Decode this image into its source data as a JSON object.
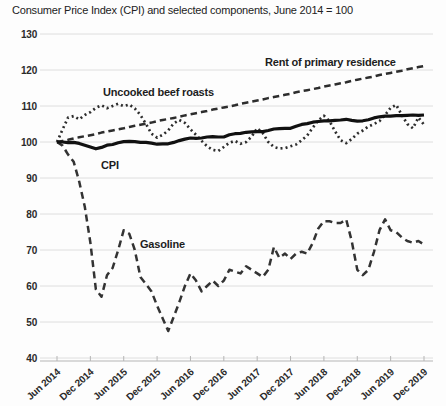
{
  "header": {
    "title": "Consumer Price Index (CPI) and selected components, June 2014 = 100"
  },
  "chart_data": {
    "type": "line",
    "title": "Consumer Price Index (CPI) and selected components, June 2014 = 100",
    "x_unit": "month",
    "x_range": [
      "Jun 2014",
      "Dec 2019"
    ],
    "x_tick_labels": [
      "Jun 2014",
      "Dec 2014",
      "Jun 2015",
      "Dec 2015",
      "Jun 2016",
      "Dec 2016",
      "Jun 2017",
      "Dec 2017",
      "Jun 2018",
      "Dec 2018",
      "Jun 2019",
      "Dec 2019"
    ],
    "y_ticks": [
      40,
      50,
      60,
      70,
      80,
      90,
      100,
      110,
      120,
      130
    ],
    "ylim": [
      40,
      130
    ],
    "grid": "horizontal",
    "legend": "inline-labels",
    "line_color": "#2d2d2d",
    "series": [
      {
        "id": "beef",
        "name": "Uncooked beef roasts",
        "style": "dotted",
        "color": "#2d2d2d",
        "label_pos": {
          "x": 103,
          "y": 96
        },
        "values": [
          100,
          103.5,
          106.8,
          107.2,
          106.3,
          107.5,
          108.3,
          109.5,
          110.2,
          109.4,
          110.0,
          110.6,
          110.0,
          110.4,
          109.3,
          107.5,
          105.0,
          102.3,
          101.2,
          102.0,
          103.2,
          105.2,
          106.1,
          105.3,
          103.5,
          102.0,
          100.3,
          98.8,
          97.8,
          97.5,
          98.6,
          99.8,
          100.3,
          99.5,
          100.0,
          101.5,
          103.8,
          102.5,
          100.0,
          98.6,
          98.2,
          98.3,
          98.8,
          99.3,
          100.5,
          101.8,
          104.0,
          106.0,
          107.3,
          105.8,
          103.0,
          100.5,
          99.7,
          100.8,
          102.3,
          103.2,
          104.3,
          105.0,
          105.8,
          107.5,
          109.5,
          110.3,
          107.5,
          105.0,
          103.8,
          106.8,
          104.8
        ]
      },
      {
        "id": "rent",
        "name": "Rent of primary residence",
        "style": "dashed",
        "color": "#2d2d2d",
        "label_pos": {
          "x": 265,
          "y": 66
        },
        "values": [
          100,
          100.3,
          100.6,
          101.0,
          101.3,
          101.6,
          101.9,
          102.2,
          102.6,
          102.9,
          103.2,
          103.5,
          103.8,
          104.2,
          104.5,
          104.8,
          105.1,
          105.4,
          105.8,
          106.1,
          106.4,
          106.7,
          107.0,
          107.4,
          107.7,
          108.0,
          108.3,
          108.6,
          109.0,
          109.3,
          109.6,
          109.9,
          110.2,
          110.6,
          110.9,
          111.2,
          111.5,
          111.8,
          112.2,
          112.5,
          112.8,
          113.1,
          113.4,
          113.8,
          114.1,
          114.4,
          114.7,
          115.0,
          115.4,
          115.7,
          116.0,
          116.3,
          116.6,
          117.0,
          117.3,
          117.6,
          117.9,
          118.2,
          118.6,
          118.9,
          119.2,
          119.5,
          119.8,
          120.2,
          120.5,
          120.8,
          121.1
        ]
      },
      {
        "id": "gasoline",
        "name": "Gasoline",
        "style": "longdash",
        "color": "#333333",
        "label_pos": {
          "x": 140,
          "y": 248
        },
        "values": [
          100,
          99.0,
          96.5,
          94.5,
          89.0,
          82.0,
          72.0,
          59.0,
          57.0,
          63.0,
          65.0,
          70.0,
          75.5,
          74.5,
          70.0,
          62.5,
          60.5,
          58.5,
          54.5,
          51.0,
          47.5,
          51.5,
          55.5,
          60.0,
          63.5,
          61.5,
          58.5,
          60.0,
          61.5,
          60.0,
          61.5,
          64.5,
          64.0,
          63.5,
          65.5,
          64.5,
          63.5,
          62.5,
          64.5,
          70.8,
          67.8,
          69.0,
          67.5,
          69.0,
          69.5,
          69.0,
          72.0,
          76.0,
          78.0,
          78.0,
          77.5,
          77.5,
          78.5,
          72.5,
          64.5,
          63.0,
          64.5,
          69.5,
          75.5,
          78.5,
          75.5,
          75.0,
          73.5,
          72.5,
          72.0,
          72.5,
          71.5
        ]
      },
      {
        "id": "cpi",
        "name": "CPI",
        "style": "solid",
        "color": "#111111",
        "label_pos": {
          "x": 101,
          "y": 169
        },
        "values": [
          100,
          100,
          99.8,
          99.9,
          99.6,
          99.1,
          98.6,
          98.1,
          98.5,
          99.1,
          99.3,
          99.8,
          100.1,
          100.2,
          100.1,
          99.9,
          99.9,
          99.7,
          99.4,
          99.5,
          99.5,
          99.9,
          100.4,
          100.8,
          101.1,
          101.0,
          101.1,
          101.4,
          101.5,
          101.4,
          101.4,
          102.0,
          102.3,
          102.4,
          102.7,
          102.8,
          102.9,
          102.9,
          103.2,
          103.6,
          103.7,
          103.8,
          103.8,
          104.4,
          104.9,
          105.1,
          105.5,
          105.7,
          105.9,
          105.9,
          106.0,
          106.1,
          106.3,
          106.0,
          105.8,
          105.9,
          106.2,
          106.7,
          107.0,
          107.2,
          107.2,
          107.3,
          107.3,
          107.4,
          107.5,
          107.4,
          107.5
        ]
      }
    ]
  }
}
